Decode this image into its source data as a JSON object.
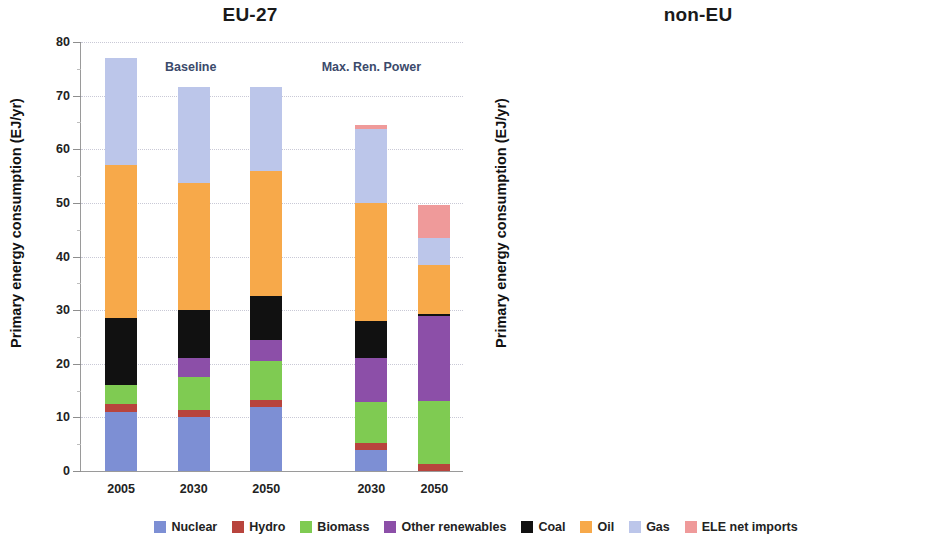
{
  "panels": [
    {
      "id": "eu",
      "title": "EU-27",
      "ylabel": "Primary energy consumption (EJ/yr)",
      "scenario_labels": [
        {
          "text": "Baseline",
          "left_pct": 22
        },
        {
          "text": "Max. Ren. Power",
          "left_pct": 63
        }
      ]
    },
    {
      "id": "noneu",
      "title": "non-EU",
      "ylabel": "Primary energy consumption (EJ/yr)",
      "scenario_labels": [
        {
          "text": "Baseline",
          "left_pct": 21
        },
        {
          "text": "Max. Ren. Power",
          "left_pct": 62
        }
      ]
    }
  ],
  "legend": {
    "items": [
      {
        "label": "Nuclear",
        "color": "#7d8fd4"
      },
      {
        "label": "Hydro",
        "color": "#b8443d"
      },
      {
        "label": "Biomass",
        "color": "#7fcb52"
      },
      {
        "label": "Other renewables",
        "color": "#8c4fa8"
      },
      {
        "label": "Coal",
        "color": "#111111"
      },
      {
        "label": "Oil",
        "color": "#f6a council"
      },
      {
        "label": "Gas",
        "color": "#bcc6ea"
      },
      {
        "label": "ELE net imports",
        "color": "#ef9a9a"
      }
    ]
  },
  "colors": {
    "nuclear": "#7d8fd4",
    "hydro": "#b8443d",
    "biomass": "#7fcb52",
    "other_renewables": "#8c4fa8",
    "coal": "#111111",
    "oil": "#f7a94a",
    "gas": "#bcc6ea",
    "ele_net_imports": "#ef9a9a"
  },
  "chart_data": [
    {
      "type": "bar",
      "stacked": true,
      "title": "EU-27",
      "xlabel": "",
      "ylabel": "Primary energy consumption (EJ/yr)",
      "ylim": [
        0,
        80
      ],
      "yticks": [
        0,
        10,
        20,
        30,
        40,
        50,
        60,
        70,
        80
      ],
      "grid": true,
      "legend_position": "bottom",
      "scenarios": [
        "Baseline",
        "Baseline",
        "Baseline",
        "Max. Ren. Power",
        "Max. Ren. Power"
      ],
      "categories": [
        "2005",
        "2030",
        "2050",
        "2030",
        "2050"
      ],
      "series": [
        {
          "name": "Nuclear",
          "values": [
            11.0,
            10.0,
            12.0,
            4.0,
            0.0
          ]
        },
        {
          "name": "Hydro",
          "values": [
            1.5,
            1.3,
            1.3,
            1.2,
            1.3
          ]
        },
        {
          "name": "Biomass",
          "values": [
            3.5,
            6.2,
            7.2,
            7.6,
            11.7
          ]
        },
        {
          "name": "Other renewables",
          "values": [
            0.0,
            3.5,
            4.0,
            8.2,
            16.0
          ]
        },
        {
          "name": "Coal",
          "values": [
            12.5,
            9.0,
            8.2,
            7.0,
            0.3
          ]
        },
        {
          "name": "Oil",
          "values": [
            28.5,
            23.7,
            23.3,
            22.0,
            9.2
          ]
        },
        {
          "name": "Gas",
          "values": [
            20.0,
            18.0,
            15.7,
            13.8,
            5.0
          ]
        },
        {
          "name": "ELE net imports",
          "values": [
            0.0,
            0.0,
            0.0,
            0.7,
            6.2
          ]
        }
      ],
      "totals": [
        77.0,
        71.7,
        71.7,
        64.5,
        49.7
      ]
    },
    {
      "type": "bar",
      "stacked": true,
      "title": "non-EU",
      "xlabel": "",
      "ylabel": "Primary energy consumption (EJ/yr)",
      "ylim": [
        0,
        50
      ],
      "yticks": [
        0,
        5,
        10,
        15,
        20,
        25,
        30,
        35,
        40,
        45,
        50
      ],
      "grid": true,
      "legend_position": "bottom",
      "scenarios": [
        "Baseline",
        "Baseline",
        "Baseline",
        "Max. Ren. Power",
        "Max. Ren. Power"
      ],
      "categories": [
        "2005",
        "2030",
        "2050",
        "2030",
        "2050"
      ],
      "series": [
        {
          "name": "Nuclear",
          "values": [
            3.0,
            5.5,
            7.8,
            5.5,
            5.5
          ]
        },
        {
          "name": "Hydro",
          "values": [
            1.0,
            1.2,
            1.2,
            1.5,
            1.5
          ]
        },
        {
          "name": "Biomass",
          "values": [
            1.0,
            2.3,
            5.0,
            4.7,
            7.0
          ]
        },
        {
          "name": "Other renewables",
          "values": [
            0.0,
            0.0,
            1.0,
            1.8,
            4.5
          ]
        },
        {
          "name": "Coal",
          "values": [
            4.0,
            6.0,
            6.8,
            1.5,
            0.5
          ]
        },
        {
          "name": "Oil",
          "values": [
            7.2,
            10.0,
            10.6,
            7.7,
            5.0
          ]
        },
        {
          "name": "Gas",
          "values": [
            16.4,
            13.4,
            12.4,
            7.5,
            3.1
          ]
        },
        {
          "name": "ELE net imports",
          "values": [
            0.0,
            0.0,
            0.0,
            0.0,
            0.2
          ]
        }
      ],
      "totals": [
        32.6,
        38.4,
        44.8,
        30.2,
        27.3
      ]
    }
  ]
}
